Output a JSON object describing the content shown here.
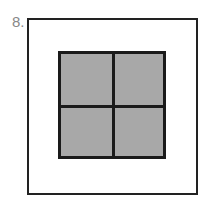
{
  "figure": {
    "label": "8.",
    "outer_square": {
      "fill": "#ffffff",
      "stroke": "#222222"
    },
    "inner_square": {
      "fill": "#a8a8a8",
      "stroke": "#1a1a1a",
      "grid": "2x2"
    }
  }
}
